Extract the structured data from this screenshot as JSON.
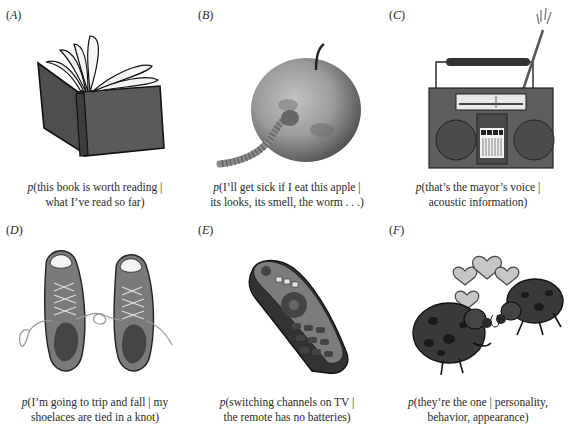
{
  "figure": {
    "panels": [
      {
        "id": "A",
        "label": "A",
        "illustration": "open-book",
        "caption_line1": "(this book is worth reading |",
        "caption_line2": "what I’ve read so far)"
      },
      {
        "id": "B",
        "label": "B",
        "illustration": "wormy-apple",
        "caption_line1": "(I’ll get sick if I eat this apple |",
        "caption_line2": "its looks, its smell, the worm . . .)"
      },
      {
        "id": "C",
        "label": "C",
        "illustration": "boombox-radio",
        "caption_line1": "(that’s the mayor’s voice |",
        "caption_line2": "acoustic information)"
      },
      {
        "id": "D",
        "label": "D",
        "illustration": "sneakers-tied-laces",
        "caption_line1": "(I’m going to trip and fall | my",
        "caption_line2": "shoelaces are tied in a knot)"
      },
      {
        "id": "E",
        "label": "E",
        "illustration": "tv-remote",
        "caption_line1": "(switching channels on TV |",
        "caption_line2": "the remote has no batteries)"
      },
      {
        "id": "F",
        "label": "F",
        "illustration": "ladybugs-in-love",
        "caption_line1": "(they’re the one | personality,",
        "caption_line2": "behavior, appearance)"
      }
    ],
    "prob_symbol": "p",
    "paren_open": "(",
    "paren_close": ")",
    "colors": {
      "ink": "#1a1a1a",
      "dark_fill": "#5a5a5a",
      "mid_fill": "#8a8a8a",
      "light_fill": "#c8c8c8",
      "page": "#ffffff"
    }
  }
}
